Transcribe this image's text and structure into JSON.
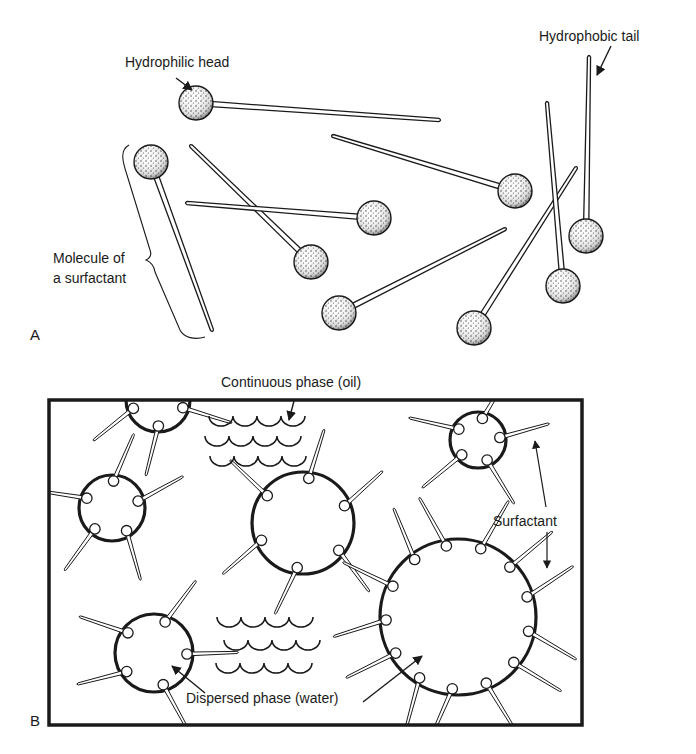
{
  "figure": {
    "panel_a": {
      "letter": "A",
      "labels": {
        "head": "Hydrophilic head",
        "tail": "Hydrophobic tail",
        "molecule_line1": "Molecule of",
        "molecule_line2": "a surfactant"
      },
      "molecules": [
        {
          "head": [
            196,
            103
          ],
          "tail": [
            439,
            120
          ]
        },
        {
          "head": [
            151,
            162
          ],
          "tail": [
            212,
            330
          ]
        },
        {
          "head": [
            311,
            262
          ],
          "tail": [
            191,
            146
          ]
        },
        {
          "head": [
            374,
            218
          ],
          "tail": [
            187,
            203
          ]
        },
        {
          "head": [
            515,
            191
          ],
          "tail": [
            333,
            136
          ]
        },
        {
          "head": [
            339,
            313
          ],
          "tail": [
            505,
            229
          ]
        },
        {
          "head": [
            474,
            328
          ],
          "tail": [
            576,
            168
          ]
        },
        {
          "head": [
            563,
            286
          ],
          "tail": [
            547,
            103
          ]
        },
        {
          "head": [
            586,
            236
          ],
          "tail": [
            589,
            57
          ]
        }
      ]
    },
    "panel_b": {
      "letter": "B",
      "labels": {
        "continuous": "Continuous phase (oil)",
        "surfactant": "Surfactant",
        "dispersed": "Dispersed phase (water)"
      },
      "box": {
        "x": 49,
        "y": 400,
        "w": 533,
        "h": 325
      },
      "droplets": [
        {
          "cx": 158,
          "cy": 400,
          "r": 32
        },
        {
          "cx": 112,
          "cy": 508,
          "r": 33
        },
        {
          "cx": 303,
          "cy": 523,
          "r": 51
        },
        {
          "cx": 478,
          "cy": 440,
          "r": 28
        },
        {
          "cx": 458,
          "cy": 617,
          "r": 78
        },
        {
          "cx": 154,
          "cy": 653,
          "r": 39
        }
      ]
    }
  }
}
